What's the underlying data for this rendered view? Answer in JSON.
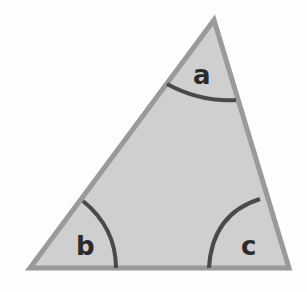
{
  "diagram": {
    "type": "triangle",
    "vertices": {
      "top": [
        214,
        20
      ],
      "bottom_left": [
        30,
        268
      ],
      "bottom_right": [
        289,
        268
      ]
    },
    "colors": {
      "fill": "#cfcfcf",
      "edge": "#9a9a9a",
      "arc": "#4a4a4a",
      "label": "#2b2b2b"
    },
    "angles": [
      {
        "id": "a",
        "label": "a",
        "vertex": "top"
      },
      {
        "id": "b",
        "label": "b",
        "vertex": "bottom_left"
      },
      {
        "id": "c",
        "label": "c",
        "vertex": "bottom_right"
      }
    ]
  }
}
